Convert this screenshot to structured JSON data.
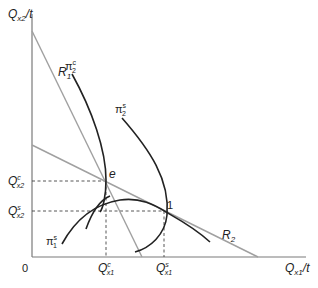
{
  "diagram": {
    "axes": {
      "y_label_main": "Q",
      "y_label_sub": "x2",
      "y_label_suffix": "/t",
      "x_label_main": "Q",
      "x_label_sub": "x1",
      "x_label_suffix": "/t",
      "origin": "0"
    },
    "lines": {
      "r1": {
        "label": "R",
        "sub": "1",
        "color": "#a0a0a0"
      },
      "r2": {
        "label": "R",
        "sub": "2",
        "color": "#a0a0a0"
      }
    },
    "curves": {
      "pi2c": {
        "label": "π",
        "sub": "2",
        "sup": "c"
      },
      "pi2s": {
        "label": "π",
        "sub": "2",
        "sup": "s"
      },
      "pi1s": {
        "label": "π",
        "sub": "1",
        "sup": "s"
      },
      "pi1_top": {
        "label": ""
      }
    },
    "points": {
      "e": {
        "label": "e"
      },
      "one": {
        "label": "1"
      }
    },
    "ticks": {
      "qx2c": {
        "main": "Q",
        "sub": "x2",
        "sup": "c"
      },
      "qx2s": {
        "main": "Q",
        "sub": "x2",
        "sup": "s"
      },
      "qx1c": {
        "main": "Q",
        "sub": "x1",
        "sup": "c"
      },
      "qx1s": {
        "main": "Q",
        "sub": "x1",
        "sup": "s"
      }
    },
    "colors": {
      "axis": "#7a7a7a",
      "reaction_line": "#a0a0a0",
      "curve": "#222222",
      "dashed": "#444444"
    }
  }
}
